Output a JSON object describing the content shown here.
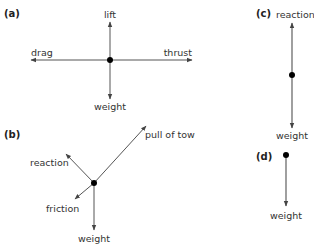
{
  "diagram": {
    "type": "free-body force diagrams",
    "colors": {
      "line": "#555555",
      "dot": "#000000",
      "text": "#333333"
    },
    "panels": [
      {
        "id": "a",
        "label": "(a)",
        "forces": [
          {
            "name": "lift",
            "direction": "up"
          },
          {
            "name": "weight",
            "direction": "down"
          },
          {
            "name": "drag",
            "direction": "left"
          },
          {
            "name": "thrust",
            "direction": "right"
          }
        ]
      },
      {
        "id": "b",
        "label": "(b)",
        "forces": [
          {
            "name": "pull of tow",
            "direction": "up-right"
          },
          {
            "name": "reaction",
            "direction": "up-left"
          },
          {
            "name": "friction",
            "direction": "down-left"
          },
          {
            "name": "weight",
            "direction": "down"
          }
        ]
      },
      {
        "id": "c",
        "label": "(c)",
        "forces": [
          {
            "name": "reaction",
            "direction": "up"
          },
          {
            "name": "weight",
            "direction": "down"
          }
        ]
      },
      {
        "id": "d",
        "label": "(d)",
        "forces": [
          {
            "name": "weight",
            "direction": "down"
          }
        ]
      }
    ]
  },
  "labels": {
    "a_panel": "(a)",
    "a_lift": "lift",
    "a_weight": "weight",
    "a_drag": "drag",
    "a_thrust": "thrust",
    "b_panel": "(b)",
    "b_pull": "pull of tow",
    "b_reaction": "reaction",
    "b_friction": "friction",
    "b_weight": "weight",
    "c_panel": "(c)",
    "c_reaction": "reaction",
    "c_weight": "weight",
    "d_panel": "(d)",
    "d_weight": "weight"
  }
}
